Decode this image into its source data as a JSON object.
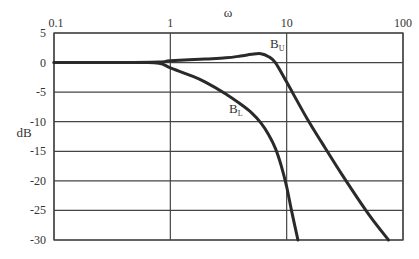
{
  "chart_data": {
    "type": "line",
    "title": "",
    "xlabel": "ω",
    "ylabel": "dB",
    "xscale": "log",
    "xlim": [
      0.1,
      100
    ],
    "ylim": [
      -30,
      5
    ],
    "grid": true,
    "x_ticks": [
      "0.1",
      "1",
      "10",
      "100"
    ],
    "x_tick_values": [
      0.1,
      1,
      10,
      100
    ],
    "y_ticks": [
      "5",
      "0",
      "-5",
      "-10",
      "-15",
      "-20",
      "-25",
      "-30"
    ],
    "y_tick_values": [
      5,
      0,
      -5,
      -10,
      -15,
      -20,
      -25,
      -30
    ],
    "series": [
      {
        "name": "B_U",
        "label_main": "B",
        "label_sub": "U",
        "x": [
          0.1,
          0.3,
          0.8,
          1,
          2,
          3,
          4,
          5,
          6,
          7,
          8,
          10,
          15,
          20,
          30,
          50,
          75
        ],
        "values": [
          0,
          0,
          0.1,
          0.3,
          0.6,
          0.8,
          1.1,
          1.4,
          1.5,
          1.0,
          0,
          -3.3,
          -9.5,
          -13.5,
          -19,
          -25.5,
          -30
        ]
      },
      {
        "name": "B_L",
        "label_main": "B",
        "label_sub": "L",
        "x": [
          0.1,
          0.5,
          0.8,
          1,
          1.5,
          2,
          3,
          4,
          5,
          6,
          7,
          8,
          9,
          10,
          11,
          12.5
        ],
        "values": [
          0,
          0,
          -0.1,
          -0.9,
          -2.2,
          -3.3,
          -5.3,
          -7,
          -8.5,
          -10.2,
          -12.2,
          -14.5,
          -17.5,
          -21,
          -25,
          -30
        ]
      }
    ],
    "annotations": [
      {
        "text": "B_U",
        "x": 7.2,
        "y": 2.5
      },
      {
        "text": "B_L",
        "x": 3.2,
        "y": -8.5
      }
    ],
    "legend": "none (inline labels)"
  }
}
